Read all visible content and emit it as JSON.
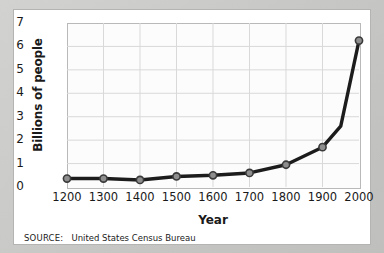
{
  "figure": {
    "source_note_label": "SOURCE:",
    "source_note_value": "United States Census Bureau"
  },
  "chart_data": {
    "type": "line",
    "title": "",
    "xlabel": "Year",
    "ylabel": "Billions of people",
    "x": [
      1200,
      1300,
      1400,
      1500,
      1600,
      1700,
      1800,
      1900,
      1950,
      2000
    ],
    "values": [
      0.36,
      0.36,
      0.3,
      0.45,
      0.5,
      0.6,
      0.95,
      1.7,
      2.6,
      6.25
    ],
    "markers_shown": [
      true,
      true,
      true,
      true,
      true,
      true,
      true,
      true,
      false,
      true
    ],
    "xlim": [
      1200,
      2000
    ],
    "ylim": [
      0,
      7
    ],
    "xticks": [
      "1200",
      "1300",
      "1400",
      "1500",
      "1600",
      "1700",
      "1800",
      "1900",
      "2000"
    ],
    "xtick_values": [
      1200,
      1300,
      1400,
      1500,
      1600,
      1700,
      1800,
      1900,
      2000
    ],
    "yticks": [
      "0",
      "1",
      "2",
      "3",
      "4",
      "5",
      "6",
      "7"
    ],
    "ytick_values": [
      0,
      1,
      2,
      3,
      4,
      5,
      6,
      7
    ],
    "grid": true,
    "legend": "none",
    "line_color": "#1c1c1c",
    "marker_fill": "#8e8e8e",
    "marker_edge": "#3a3a3a",
    "grid_color": "#d9d9d9",
    "plot_bg": "#fcfcfc",
    "card_bg": "#ffffff",
    "page_bg": "#c9c9c7"
  }
}
